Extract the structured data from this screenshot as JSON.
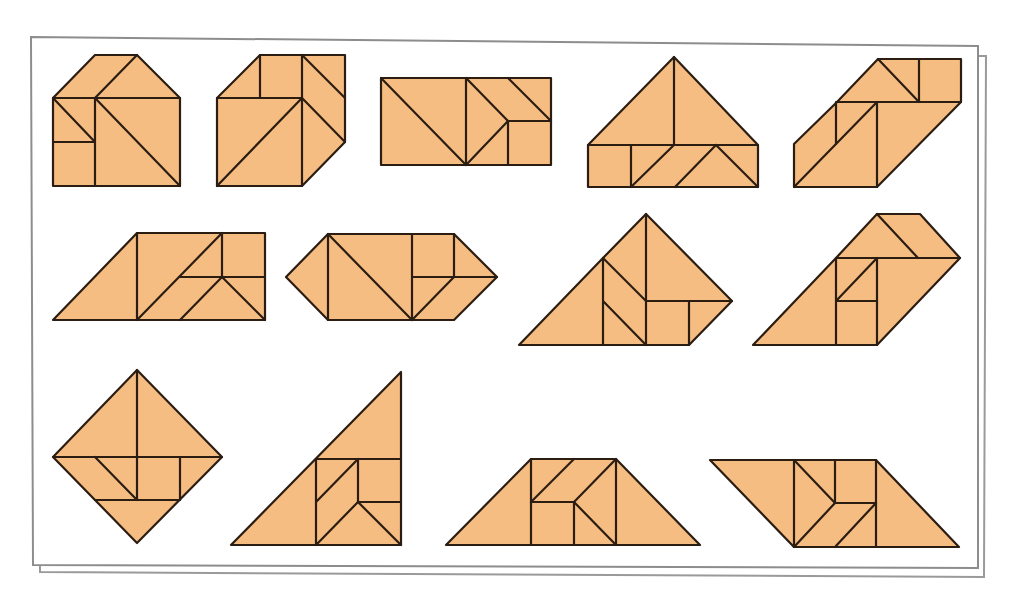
{
  "page": {
    "caption": ""
  },
  "colors": {
    "piece_fill": "#f6bd82",
    "piece_stroke": "#2b1d12",
    "frame_stroke": "#8d8d8d",
    "background": "#ffffff"
  },
  "frame": {
    "front": [
      30,
      37,
      948,
      530
    ],
    "back_offset": [
      6,
      10
    ]
  },
  "figures": [
    {
      "name": "house",
      "outline": [
        [
          95,
          55
        ],
        [
          137,
          55
        ],
        [
          180,
          98
        ],
        [
          180,
          186
        ],
        [
          53,
          186
        ],
        [
          53,
          98
        ]
      ],
      "lines": [
        [
          [
            53,
            98
          ],
          [
            180,
            98
          ]
        ],
        [
          [
            95,
            98
          ],
          [
            95,
            186
          ]
        ],
        [
          [
            95,
            98
          ],
          [
            137,
            55
          ]
        ],
        [
          [
            53,
            98
          ],
          [
            95,
            142
          ]
        ],
        [
          [
            53,
            142
          ],
          [
            95,
            142
          ]
        ],
        [
          [
            95,
            98
          ],
          [
            180,
            186
          ]
        ]
      ]
    },
    {
      "name": "cube",
      "outline": [
        [
          260,
          55
        ],
        [
          345,
          55
        ],
        [
          345,
          142
        ],
        [
          302,
          186
        ],
        [
          217,
          186
        ],
        [
          217,
          98
        ]
      ],
      "lines": [
        [
          [
            217,
            98
          ],
          [
            302,
            98
          ]
        ],
        [
          [
            260,
            55
          ],
          [
            260,
            98
          ]
        ],
        [
          [
            302,
            55
          ],
          [
            302,
            186
          ]
        ],
        [
          [
            302,
            55
          ],
          [
            345,
            98
          ]
        ],
        [
          [
            302,
            98
          ],
          [
            345,
            142
          ]
        ],
        [
          [
            217,
            186
          ],
          [
            302,
            98
          ]
        ]
      ]
    },
    {
      "name": "rectangle",
      "outline": [
        [
          381,
          78
        ],
        [
          551,
          78
        ],
        [
          551,
          165
        ],
        [
          381,
          165
        ]
      ],
      "lines": [
        [
          [
            381,
            78
          ],
          [
            466,
            165
          ]
        ],
        [
          [
            466,
            78
          ],
          [
            466,
            165
          ]
        ],
        [
          [
            466,
            78
          ],
          [
            508,
            121
          ]
        ],
        [
          [
            508,
            78
          ],
          [
            551,
            121
          ]
        ],
        [
          [
            508,
            121
          ],
          [
            551,
            121
          ]
        ],
        [
          [
            508,
            121
          ],
          [
            508,
            165
          ]
        ],
        [
          [
            466,
            165
          ],
          [
            508,
            121
          ]
        ]
      ]
    },
    {
      "name": "roof-house",
      "outline": [
        [
          674,
          57
        ],
        [
          758,
          145
        ],
        [
          758,
          187
        ],
        [
          588,
          187
        ],
        [
          588,
          145
        ]
      ],
      "lines": [
        [
          [
            588,
            145
          ],
          [
            758,
            145
          ]
        ],
        [
          [
            674,
            57
          ],
          [
            674,
            145
          ]
        ],
        [
          [
            631,
            145
          ],
          [
            631,
            187
          ]
        ],
        [
          [
            631,
            187
          ],
          [
            674,
            145
          ]
        ],
        [
          [
            675,
            187
          ],
          [
            716,
            145
          ]
        ],
        [
          [
            716,
            145
          ],
          [
            758,
            187
          ]
        ]
      ]
    },
    {
      "name": "parallelogram-step",
      "outline": [
        [
          878,
          59
        ],
        [
          961,
          59
        ],
        [
          961,
          102
        ],
        [
          877,
          187
        ],
        [
          794,
          187
        ],
        [
          794,
          144
        ],
        [
          837,
          102
        ]
      ],
      "lines": [
        [
          [
            837,
            102
          ],
          [
            961,
            102
          ]
        ],
        [
          [
            878,
            59
          ],
          [
            919,
            102
          ]
        ],
        [
          [
            919,
            59
          ],
          [
            919,
            102
          ]
        ],
        [
          [
            836,
            102
          ],
          [
            836,
            144
          ]
        ],
        [
          [
            877,
            102
          ],
          [
            877,
            187
          ]
        ],
        [
          [
            794,
            187
          ],
          [
            877,
            102
          ]
        ]
      ]
    },
    {
      "name": "trapezoid-left",
      "outline": [
        [
          137,
          233
        ],
        [
          265,
          233
        ],
        [
          265,
          320
        ],
        [
          53,
          320
        ]
      ],
      "lines": [
        [
          [
            137,
            233
          ],
          [
            137,
            320
          ]
        ],
        [
          [
            137,
            320
          ],
          [
            222,
            233
          ]
        ],
        [
          [
            222,
            233
          ],
          [
            222,
            277
          ]
        ],
        [
          [
            180,
            277
          ],
          [
            265,
            277
          ]
        ],
        [
          [
            180,
            320
          ],
          [
            222,
            277
          ]
        ],
        [
          [
            222,
            277
          ],
          [
            265,
            320
          ]
        ]
      ]
    },
    {
      "name": "hexagon",
      "outline": [
        [
          328,
          234
        ],
        [
          454,
          234
        ],
        [
          497,
          277
        ],
        [
          454,
          320
        ],
        [
          328,
          320
        ],
        [
          286,
          277
        ]
      ],
      "lines": [
        [
          [
            328,
            234
          ],
          [
            328,
            320
          ]
        ],
        [
          [
            328,
            234
          ],
          [
            412,
            320
          ]
        ],
        [
          [
            412,
            234
          ],
          [
            412,
            320
          ]
        ],
        [
          [
            454,
            234
          ],
          [
            454,
            277
          ]
        ],
        [
          [
            412,
            277
          ],
          [
            497,
            277
          ]
        ],
        [
          [
            412,
            320
          ],
          [
            454,
            277
          ]
        ]
      ]
    },
    {
      "name": "mountain",
      "outline": [
        [
          646,
          214
        ],
        [
          732,
          301
        ],
        [
          689,
          345
        ],
        [
          519,
          345
        ],
        [
          603,
          258
        ]
      ],
      "lines": [
        [
          [
            646,
            214
          ],
          [
            646,
            345
          ]
        ],
        [
          [
            603,
            258
          ],
          [
            603,
            345
          ]
        ],
        [
          [
            603,
            258
          ],
          [
            646,
            301
          ]
        ],
        [
          [
            603,
            301
          ],
          [
            646,
            345
          ]
        ],
        [
          [
            646,
            301
          ],
          [
            732,
            301
          ]
        ],
        [
          [
            689,
            301
          ],
          [
            689,
            345
          ]
        ]
      ]
    },
    {
      "name": "boot",
      "outline": [
        [
          877,
          214
        ],
        [
          920,
          214
        ],
        [
          960,
          258
        ],
        [
          877,
          345
        ],
        [
          753,
          345
        ],
        [
          836,
          258
        ]
      ],
      "lines": [
        [
          [
            836,
            258
          ],
          [
            960,
            258
          ]
        ],
        [
          [
            877,
            214
          ],
          [
            918,
            258
          ]
        ],
        [
          [
            836,
            258
          ],
          [
            836,
            345
          ]
        ],
        [
          [
            877,
            258
          ],
          [
            877,
            345
          ]
        ],
        [
          [
            836,
            301
          ],
          [
            877,
            258
          ]
        ],
        [
          [
            836,
            301
          ],
          [
            877,
            301
          ]
        ]
      ]
    },
    {
      "name": "diamond",
      "outline": [
        [
          137,
          370
        ],
        [
          222,
          457
        ],
        [
          137,
          543
        ],
        [
          53,
          457
        ]
      ],
      "lines": [
        [
          [
            53,
            457
          ],
          [
            222,
            457
          ]
        ],
        [
          [
            137,
            370
          ],
          [
            137,
            500
          ]
        ],
        [
          [
            95,
            457
          ],
          [
            137,
            500
          ]
        ],
        [
          [
            95,
            500
          ],
          [
            180,
            500
          ]
        ],
        [
          [
            180,
            457
          ],
          [
            180,
            500
          ]
        ]
      ]
    },
    {
      "name": "right-triangle",
      "outline": [
        [
          401,
          372
        ],
        [
          401,
          545
        ],
        [
          231,
          545
        ]
      ],
      "lines": [
        [
          [
            316,
            459
          ],
          [
            401,
            459
          ]
        ],
        [
          [
            316,
            459
          ],
          [
            316,
            545
          ]
        ],
        [
          [
            358,
            459
          ],
          [
            358,
            502
          ]
        ],
        [
          [
            316,
            502
          ],
          [
            358,
            459
          ]
        ],
        [
          [
            358,
            502
          ],
          [
            401,
            502
          ]
        ],
        [
          [
            316,
            545
          ],
          [
            358,
            502
          ]
        ],
        [
          [
            358,
            502
          ],
          [
            401,
            545
          ]
        ]
      ]
    },
    {
      "name": "trapezoid-center",
      "outline": [
        [
          531,
          459
        ],
        [
          616,
          459
        ],
        [
          700,
          545
        ],
        [
          446,
          545
        ]
      ],
      "lines": [
        [
          [
            531,
            459
          ],
          [
            531,
            545
          ]
        ],
        [
          [
            616,
            459
          ],
          [
            616,
            545
          ]
        ],
        [
          [
            531,
            502
          ],
          [
            574,
            459
          ]
        ],
        [
          [
            574,
            502
          ],
          [
            616,
            459
          ]
        ],
        [
          [
            531,
            502
          ],
          [
            574,
            502
          ]
        ],
        [
          [
            574,
            502
          ],
          [
            574,
            545
          ]
        ],
        [
          [
            574,
            502
          ],
          [
            616,
            545
          ]
        ]
      ]
    },
    {
      "name": "parallelogram-right",
      "outline": [
        [
          710,
          460
        ],
        [
          876,
          460
        ],
        [
          959,
          547
        ],
        [
          794,
          547
        ]
      ],
      "lines": [
        [
          [
            794,
            460
          ],
          [
            794,
            547
          ]
        ],
        [
          [
            876,
            460
          ],
          [
            876,
            547
          ]
        ],
        [
          [
            835,
            460
          ],
          [
            835,
            503
          ]
        ],
        [
          [
            794,
            460
          ],
          [
            835,
            503
          ]
        ],
        [
          [
            835,
            503
          ],
          [
            876,
            503
          ]
        ],
        [
          [
            794,
            547
          ],
          [
            835,
            503
          ]
        ],
        [
          [
            835,
            547
          ],
          [
            876,
            503
          ]
        ]
      ]
    }
  ]
}
